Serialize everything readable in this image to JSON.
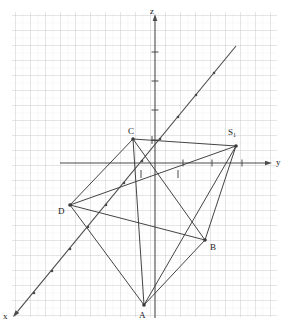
{
  "figure": {
    "kind": "3d-coordinate-geometry-diagram",
    "background_color": "#ffffff",
    "grid": {
      "visible": true,
      "minor_spacing_px": 7.5,
      "major_spacing_px": 15,
      "minor_color": "#e8e8ea",
      "major_color": "#c8c8cc",
      "area": {
        "x": 12,
        "y": 12,
        "width": 265,
        "height": 305
      }
    },
    "axes": {
      "color": "#4a4a4a",
      "origin": {
        "x": 155,
        "y": 163
      },
      "items": [
        {
          "name": "z",
          "label": "z",
          "label_x": 150,
          "label_y": 7,
          "from": {
            "x": 155,
            "y": 318
          },
          "to": {
            "x": 155,
            "y": 14
          },
          "arrow": true
        },
        {
          "name": "y",
          "label": "y",
          "label_x": 276,
          "label_y": 158,
          "from": {
            "x": 60,
            "y": 163
          },
          "to": {
            "x": 272,
            "y": 163
          },
          "arrow": true
        },
        {
          "name": "x",
          "label": "x",
          "label_x": 3,
          "label_y": 312,
          "from": {
            "x": 236,
            "y": 46
          },
          "to": {
            "x": 13,
            "y": 317
          },
          "arrow": true
        }
      ],
      "ticks_on_y": [
        {
          "x": 183,
          "y": 163
        },
        {
          "x": 212,
          "y": 163
        },
        {
          "x": 242,
          "y": 163
        }
      ],
      "ticks_on_z": [
        {
          "x": 155,
          "y": 140
        },
        {
          "x": 155,
          "y": 110
        },
        {
          "x": 155,
          "y": 81
        },
        {
          "x": 155,
          "y": 52
        }
      ],
      "ticks_near_origin": [
        {
          "x": 141,
          "y": 174
        },
        {
          "x": 152,
          "y": 140
        },
        {
          "x": 178,
          "y": 174
        }
      ],
      "x_axis_tick_dots": [
        {
          "x": 214,
          "y": 73
        },
        {
          "x": 196,
          "y": 95
        },
        {
          "x": 178,
          "y": 117
        },
        {
          "x": 160,
          "y": 139
        },
        {
          "x": 142,
          "y": 161
        },
        {
          "x": 124,
          "y": 183
        },
        {
          "x": 106,
          "y": 205
        },
        {
          "x": 88,
          "y": 227
        },
        {
          "x": 70,
          "y": 249
        },
        {
          "x": 52,
          "y": 271
        },
        {
          "x": 34,
          "y": 293
        }
      ]
    },
    "solid": {
      "description": "pyramid with quadrilateral base ABCD and apex S1",
      "edge_color": "#3a3a3a",
      "vertices": [
        {
          "id": "A",
          "label": "A",
          "x": 144,
          "y": 305,
          "label_x": 139,
          "label_y": 311,
          "dot": true
        },
        {
          "id": "B",
          "label": "B",
          "x": 205,
          "y": 240,
          "label_x": 210,
          "label_y": 243,
          "dot": true
        },
        {
          "id": "C",
          "label": "C",
          "x": 133,
          "y": 139,
          "label_x": 128,
          "label_y": 127,
          "dot": true
        },
        {
          "id": "D",
          "label": "D",
          "x": 70,
          "y": 205,
          "label_x": 58,
          "label_y": 207,
          "dot": true
        },
        {
          "id": "S1",
          "label": "S",
          "sublabel": "1",
          "x": 236,
          "y": 146,
          "label_x": 228,
          "label_y": 128,
          "dot": true
        }
      ],
      "edges": [
        {
          "from": "A",
          "to": "B"
        },
        {
          "from": "B",
          "to": "C"
        },
        {
          "from": "C",
          "to": "D"
        },
        {
          "from": "D",
          "to": "A"
        },
        {
          "from": "A",
          "to": "C"
        },
        {
          "from": "B",
          "to": "D"
        },
        {
          "from": "S1",
          "to": "A"
        },
        {
          "from": "S1",
          "to": "B"
        },
        {
          "from": "S1",
          "to": "C"
        },
        {
          "from": "S1",
          "to": "D"
        }
      ]
    }
  }
}
